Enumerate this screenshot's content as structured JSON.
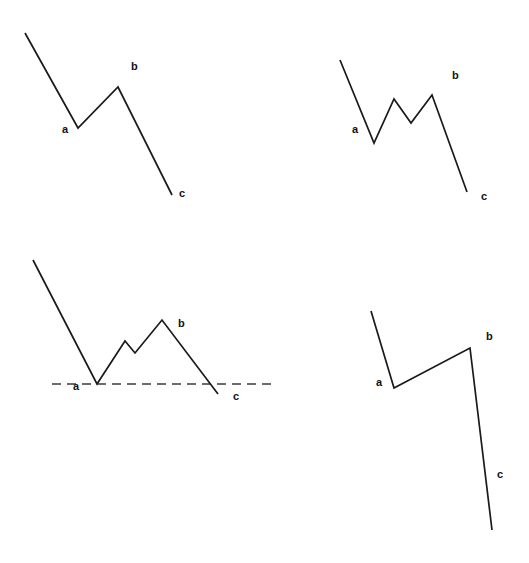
{
  "figure": {
    "background_color": "#ffffff",
    "stroke_color": "#1a1a1a",
    "baseline_color": "#3b3b3b",
    "label_color": "#111111",
    "width": 529,
    "height": 563
  },
  "chart_data": [
    {
      "id": "zigzag-simple",
      "type": "line",
      "title": "",
      "xlabel": "",
      "ylabel": "",
      "grid": false,
      "legend": null,
      "baseline": null,
      "points": [
        {
          "x": 25,
          "y": 33,
          "label": null
        },
        {
          "x": 78,
          "y": 128,
          "label": "a"
        },
        {
          "x": 118,
          "y": 87,
          "label": "b"
        },
        {
          "x": 172,
          "y": 195,
          "label": "c"
        }
      ],
      "annotations": [
        {
          "text": "a",
          "x": 62,
          "y": 130
        },
        {
          "text": "b",
          "x": 131,
          "y": 67
        },
        {
          "text": "c",
          "x": 179,
          "y": 194
        }
      ]
    },
    {
      "id": "zigzag-flat-b",
      "type": "line",
      "title": "",
      "xlabel": "",
      "ylabel": "",
      "grid": false,
      "legend": null,
      "baseline": null,
      "points": [
        {
          "x": 340,
          "y": 60,
          "label": null
        },
        {
          "x": 374,
          "y": 143,
          "label": "a"
        },
        {
          "x": 394,
          "y": 99,
          "label": null
        },
        {
          "x": 411,
          "y": 123,
          "label": null
        },
        {
          "x": 432,
          "y": 95,
          "label": "b"
        },
        {
          "x": 467,
          "y": 192,
          "label": "c"
        }
      ],
      "annotations": [
        {
          "text": "a",
          "x": 352,
          "y": 130
        },
        {
          "text": "b",
          "x": 452,
          "y": 76
        },
        {
          "text": "c",
          "x": 481,
          "y": 197
        }
      ]
    },
    {
      "id": "zigzag-with-baseline",
      "type": "line",
      "title": "",
      "xlabel": "",
      "ylabel": "",
      "grid": false,
      "legend": null,
      "baseline": {
        "y": 384,
        "x_start": 52,
        "x_end": 277,
        "style": "dashed"
      },
      "points": [
        {
          "x": 33,
          "y": 260,
          "label": null
        },
        {
          "x": 97,
          "y": 384,
          "label": "a"
        },
        {
          "x": 125,
          "y": 341,
          "label": null
        },
        {
          "x": 135,
          "y": 353,
          "label": null
        },
        {
          "x": 162,
          "y": 320,
          "label": "b"
        },
        {
          "x": 218,
          "y": 394,
          "label": "c"
        }
      ],
      "annotations": [
        {
          "text": "a",
          "x": 75,
          "y": 386
        },
        {
          "text": "b",
          "x": 180,
          "y": 324
        },
        {
          "text": "c",
          "x": 235,
          "y": 396
        }
      ]
    },
    {
      "id": "zigzag-steep-c",
      "type": "line",
      "title": "",
      "xlabel": "",
      "ylabel": "",
      "grid": false,
      "legend": null,
      "baseline": null,
      "points": [
        {
          "x": 371,
          "y": 311,
          "label": null
        },
        {
          "x": 394,
          "y": 388,
          "label": "a"
        },
        {
          "x": 470,
          "y": 348,
          "label": "b"
        },
        {
          "x": 492,
          "y": 530,
          "label": "c"
        }
      ],
      "annotations": [
        {
          "text": "a",
          "x": 376,
          "y": 382
        },
        {
          "text": "b",
          "x": 486,
          "y": 337
        },
        {
          "text": "c",
          "x": 497,
          "y": 475
        }
      ]
    }
  ]
}
